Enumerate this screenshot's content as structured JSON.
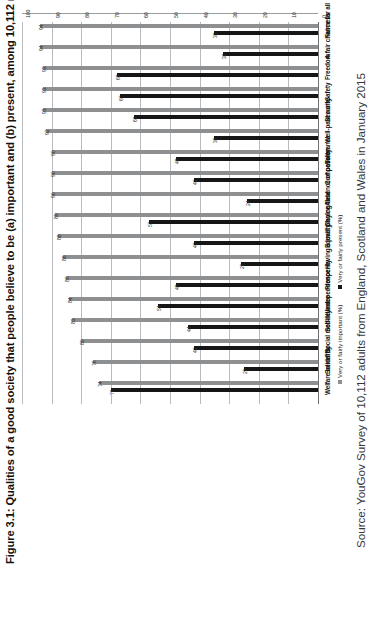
{
  "figure": {
    "title": "Figure 3.1: Qualities of a good society that people believe to be (a) important and (b) present, among 10,112 respondents",
    "source": "Source: YouGov Survey of 10,112 adults from England, Scotland and Wales in January 2015",
    "legend": [
      {
        "label": "Very or fairly important (%)",
        "color": "#8e8f91"
      },
      {
        "label": "Very or fairly present (%)",
        "color": "#161616"
      }
    ]
  },
  "chart_data": {
    "type": "bar",
    "title": "Figure 3.1: Qualities of a good society that people believe to be (a) important and (b) present, among 10,112 respondents",
    "xlabel": "",
    "ylabel": "",
    "ylim": [
      0,
      100
    ],
    "yticks": [
      0,
      10,
      20,
      30,
      40,
      50,
      60,
      70,
      80,
      90,
      100
    ],
    "grid": true,
    "legend_position": "bottom",
    "orientation": "vertical",
    "categories": [
      "Fairness",
      "A fair chance for all",
      "Freedom",
      "Safety",
      "Security",
      "Well-paid work",
      "Tolerance",
      "Compassion",
      "Absence of poverty",
      "Choice",
      "Equality",
      "Having a level playing field",
      "Prosperity",
      "Independence",
      "Self-reliance",
      "Social mobility",
      "Solidarity",
      "Welfare benefits"
    ],
    "series": [
      {
        "name": "Very or fairly important (%)",
        "color": "#8e8f91",
        "values": [
          94,
          94,
          93,
          93,
          93,
          92,
          90,
          90,
          90,
          89,
          88,
          86,
          85,
          84,
          83,
          80,
          76,
          74
        ]
      },
      {
        "name": "Very or fairly present (%)",
        "color": "#161616",
        "values": [
          35,
          32,
          68,
          67,
          62,
          35,
          48,
          42,
          24,
          57,
          42,
          26,
          48,
          54,
          44,
          42,
          25,
          70
        ]
      }
    ]
  }
}
